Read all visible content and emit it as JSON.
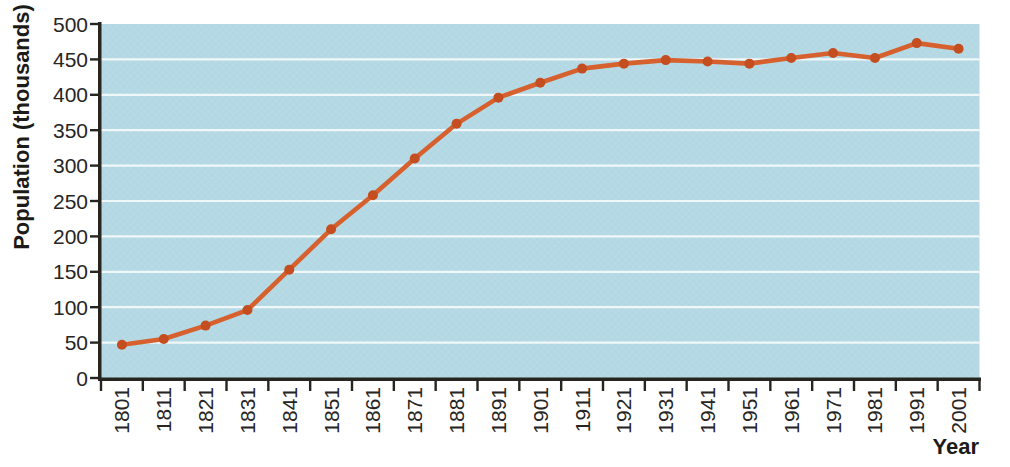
{
  "chart_style": {
    "plot_bg": "#b5d9e4",
    "grid_color": "#f0f7f9",
    "axis_color": "#27251f",
    "line_color": "#d6602e",
    "marker_color": "#c44e20",
    "label_color": "#27251f"
  },
  "chart_data": {
    "type": "line",
    "title": "",
    "xlabel": "Year",
    "ylabel": "Population (thousands)",
    "x": [
      1801,
      1811,
      1821,
      1831,
      1841,
      1851,
      1861,
      1871,
      1881,
      1891,
      1901,
      1911,
      1921,
      1931,
      1941,
      1951,
      1961,
      1971,
      1981,
      1991,
      2001
    ],
    "values": [
      47,
      55,
      74,
      96,
      153,
      210,
      258,
      310,
      359,
      396,
      417,
      437,
      444,
      449,
      447,
      444,
      452,
      459,
      452,
      473,
      465
    ],
    "series_name": "Population",
    "ylim": [
      0,
      500
    ],
    "ytick_step": 50,
    "yticks": [
      0,
      50,
      100,
      150,
      200,
      250,
      300,
      350,
      400,
      450,
      500
    ],
    "grid": true,
    "legend": false,
    "marker": "circle"
  }
}
